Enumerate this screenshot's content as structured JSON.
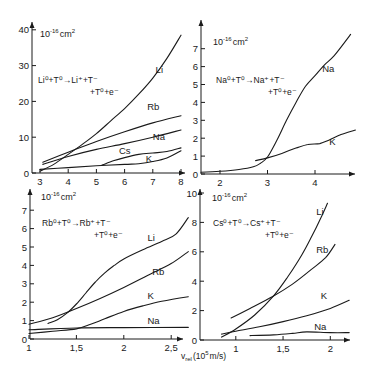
{
  "figure": {
    "x_axis_label": "v_rel (10^5 m/s)",
    "x_axis_label_main": "v",
    "x_axis_label_sub": "rel",
    "x_axis_label_unit": "(10",
    "x_axis_label_exp": "5",
    "x_axis_label_tail": "m/s)"
  },
  "chart_data": [
    {
      "type": "line",
      "panel": "top-left",
      "title": "Li0 + T0 -> Li+ + T- + T0 + e-",
      "reaction_line1": "Li⁰+T⁰→Li⁺+T⁻",
      "reaction_line2": "+T⁰+e⁻",
      "ylabel": "10^-16 cm^2",
      "xlabel": "v_rel (10^5 m/s)",
      "xlim": [
        3,
        8.1
      ],
      "ylim": [
        0,
        40
      ],
      "xticks": [
        3,
        4,
        5,
        6,
        7,
        8
      ],
      "yticks": [
        0,
        10,
        20,
        30,
        40
      ],
      "grid": false,
      "series": [
        {
          "name": "Li",
          "points": [
            [
              3.0,
              0.5
            ],
            [
              3.5,
              2.5
            ],
            [
              4.0,
              5.2
            ],
            [
              4.5,
              8
            ],
            [
              5.0,
              11
            ],
            [
              5.5,
              14.5
            ],
            [
              6.0,
              18
            ],
            [
              6.5,
              22
            ],
            [
              7.0,
              26.5
            ],
            [
              7.5,
              32
            ],
            [
              8.0,
              38.5
            ]
          ],
          "label_at": [
            7.1,
            28
          ]
        },
        {
          "name": "Rb",
          "points": [
            [
              3.1,
              3
            ],
            [
              4.0,
              5.8
            ],
            [
              5.0,
              8.8
            ],
            [
              6.0,
              11.5
            ],
            [
              7.0,
              14
            ],
            [
              8.0,
              16
            ]
          ],
          "label_at": [
            6.8,
            17.5
          ]
        },
        {
          "name": "Na",
          "points": [
            [
              3.1,
              2.4
            ],
            [
              4.0,
              4.6
            ],
            [
              5.0,
              6.6
            ],
            [
              6.0,
              8.2
            ],
            [
              7.0,
              10
            ],
            [
              8.0,
              12
            ]
          ],
          "label_at": [
            7.0,
            9.2
          ]
        },
        {
          "name": "Cs",
          "points": [
            [
              5.2,
              2.2
            ],
            [
              5.6,
              3.4
            ],
            [
              6.0,
              4.3
            ],
            [
              6.5,
              5.2
            ],
            [
              7.0,
              5.6
            ],
            [
              7.5,
              6
            ],
            [
              8.0,
              7
            ]
          ],
          "label_at": [
            5.8,
            5.2
          ]
        },
        {
          "name": "K",
          "points": [
            [
              3.0,
              1.0
            ],
            [
              4.0,
              1.5
            ],
            [
              5.0,
              2
            ],
            [
              6.0,
              2.4
            ],
            [
              6.5,
              2.6
            ],
            [
              7.0,
              3.2
            ],
            [
              7.5,
              4.2
            ],
            [
              8.0,
              6.2
            ]
          ],
          "label_at": [
            6.75,
            3.2
          ]
        }
      ]
    },
    {
      "type": "line",
      "panel": "top-right",
      "title": "Na0 + T0 -> Na+ + T- + T0 + e-",
      "reaction_line1": "Na⁰+T⁰→Na⁺+T⁻",
      "reaction_line2": "+T⁰+e⁻",
      "ylabel": "10^-16 cm^2",
      "xlabel": "v_rel (10^5 m/s)",
      "xlim": [
        1.6,
        4.85
      ],
      "ylim": [
        0,
        7.5
      ],
      "xticks": [
        2,
        3,
        4
      ],
      "yticks": [
        0,
        1,
        2,
        3,
        4,
        5,
        6,
        7
      ],
      "grid": false,
      "series": [
        {
          "name": "Na",
          "points": [
            [
              1.6,
              0.1
            ],
            [
              2.0,
              0.15
            ],
            [
              2.4,
              0.25
            ],
            [
              2.7,
              0.4
            ],
            [
              2.85,
              0.6
            ],
            [
              3.0,
              0.95
            ],
            [
              3.2,
              1.9
            ],
            [
              3.4,
              3.0
            ],
            [
              3.6,
              4.0
            ],
            [
              3.8,
              4.9
            ],
            [
              4.0,
              5.5
            ],
            [
              4.2,
              6.1
            ],
            [
              4.4,
              6.6
            ],
            [
              4.75,
              7.8
            ]
          ],
          "label_at": [
            4.15,
            5.7
          ]
        },
        {
          "name": "K",
          "points": [
            [
              2.75,
              0.75
            ],
            [
              3.0,
              0.9
            ],
            [
              3.3,
              1.15
            ],
            [
              3.6,
              1.45
            ],
            [
              3.85,
              1.65
            ],
            [
              4.1,
              1.7
            ],
            [
              4.3,
              1.9
            ],
            [
              4.55,
              2.2
            ],
            [
              4.85,
              2.45
            ]
          ],
          "label_at": [
            4.3,
            1.6
          ]
        }
      ]
    },
    {
      "type": "line",
      "panel": "bottom-left",
      "title": "Rb0 + T0 -> Rb+ + T- + T0 + e-",
      "reaction_line1": "Rb⁰+T⁰→Rb⁺+T⁻",
      "reaction_line2": "+T⁰+e⁻",
      "ylabel": "10^-16 cm^2",
      "xlabel": "v_rel (10^5 m/s)",
      "xlim": [
        1,
        2.68
      ],
      "ylim": [
        0,
        7.5
      ],
      "xticks": [
        1,
        1.5,
        2,
        2.5
      ],
      "xticklabels": [
        "1",
        "1,5",
        "2",
        "2,5"
      ],
      "yticks": [
        0,
        1,
        2,
        3,
        4,
        5,
        6,
        7
      ],
      "grid": false,
      "series": [
        {
          "name": "Li",
          "points": [
            [
              1.2,
              0.85
            ],
            [
              1.3,
              1.05
            ],
            [
              1.4,
              1.4
            ],
            [
              1.5,
              1.9
            ],
            [
              1.6,
              2.5
            ],
            [
              1.7,
              3.1
            ],
            [
              1.8,
              3.6
            ],
            [
              1.9,
              4.0
            ],
            [
              2.0,
              4.35
            ],
            [
              2.2,
              4.85
            ],
            [
              2.4,
              5.3
            ],
            [
              2.55,
              5.7
            ],
            [
              2.68,
              6.6
            ]
          ],
          "label_at": [
            2.25,
            5.3
          ]
        },
        {
          "name": "Rb",
          "points": [
            [
              1.0,
              0.8
            ],
            [
              1.25,
              1.15
            ],
            [
              1.5,
              1.65
            ],
            [
              1.75,
              2.2
            ],
            [
              2.0,
              2.8
            ],
            [
              2.25,
              3.45
            ],
            [
              2.5,
              4.1
            ],
            [
              2.68,
              4.75
            ]
          ],
          "label_at": [
            2.3,
            3.5
          ]
        },
        {
          "name": "K",
          "points": [
            [
              1.0,
              0.3
            ],
            [
              1.25,
              0.42
            ],
            [
              1.5,
              0.55
            ],
            [
              1.65,
              0.8
            ],
            [
              1.8,
              1.1
            ],
            [
              2.0,
              1.5
            ],
            [
              2.2,
              1.8
            ],
            [
              2.4,
              2.05
            ],
            [
              2.68,
              2.3
            ]
          ],
          "label_at": [
            2.25,
            2.2
          ]
        },
        {
          "name": "Na",
          "points": [
            [
              1.0,
              0.5
            ],
            [
              1.5,
              0.6
            ],
            [
              2.0,
              0.62
            ],
            [
              2.68,
              0.63
            ]
          ],
          "label_at": [
            2.25,
            0.8
          ]
        }
      ]
    },
    {
      "type": "line",
      "panel": "bottom-right",
      "title": "Cs0 + T0 -> Cs+ + T- + T0 + e-",
      "reaction_line1": "Cs⁰+T⁰→Cs⁺+T⁻",
      "reaction_line2": "+T⁰+e⁻",
      "ylabel": "10^-16 cm^2",
      "xlabel": "v_rel (10^5 m/s)",
      "xlim": [
        0.6,
        2.25
      ],
      "ylim": [
        0,
        10
      ],
      "xticks": [
        1,
        1.5,
        2
      ],
      "xticklabels": [
        "1",
        "1,5",
        "2"
      ],
      "yticks": [
        0,
        2,
        4,
        6,
        8,
        10
      ],
      "grid": false,
      "series": [
        {
          "name": "Li",
          "points": [
            [
              0.85,
              0.2
            ],
            [
              1.0,
              0.75
            ],
            [
              1.2,
              1.7
            ],
            [
              1.4,
              3.0
            ],
            [
              1.55,
              4.3
            ],
            [
              1.7,
              5.8
            ],
            [
              1.8,
              7.0
            ],
            [
              1.9,
              8.3
            ],
            [
              1.97,
              9.3
            ]
          ],
          "label_at": [
            1.85,
            8.5
          ]
        },
        {
          "name": "Rb",
          "points": [
            [
              0.95,
              1.5
            ],
            [
              1.15,
              2.15
            ],
            [
              1.4,
              3.0
            ],
            [
              1.6,
              3.8
            ],
            [
              1.8,
              4.8
            ],
            [
              1.95,
              5.6
            ],
            [
              2.05,
              6.5
            ]
          ],
          "label_at": [
            1.85,
            5.9
          ]
        },
        {
          "name": "K",
          "points": [
            [
              0.85,
              0.4
            ],
            [
              1.0,
              0.6
            ],
            [
              1.25,
              0.9
            ],
            [
              1.5,
              1.25
            ],
            [
              1.75,
              1.65
            ],
            [
              2.0,
              2.15
            ],
            [
              2.2,
              2.7
            ]
          ],
          "label_at": [
            1.9,
            2.8
          ]
        },
        {
          "name": "Na",
          "points": [
            [
              1.15,
              0.3
            ],
            [
              1.4,
              0.35
            ],
            [
              1.6,
              0.45
            ],
            [
              1.75,
              0.55
            ],
            [
              2.0,
              0.5
            ],
            [
              2.2,
              0.5
            ]
          ],
          "label_at": [
            1.83,
            0.7
          ]
        }
      ]
    }
  ],
  "layout": {
    "panels": [
      {
        "x0": 32,
        "x1": 185,
        "y0": 173,
        "ytop": 22,
        "xpx_at_min": 40,
        "xpx_per_unit": 28.2,
        "ypx_per_unit": 3.58,
        "label_pos": [
          40,
          37
        ],
        "reaction_pos": [
          38,
          83
        ]
      },
      {
        "x0": 201,
        "x1": 355,
        "y0": 174,
        "ytop": 20,
        "xpx_at_min": 201,
        "xpx_per_unit": 47.5,
        "ypx_per_unit": 17.9,
        "label_pos": [
          213,
          45
        ],
        "reaction_pos": [
          216,
          83
        ]
      },
      {
        "x0": 30,
        "x1": 183,
        "y0": 339,
        "ytop": 189,
        "xpx_at_min": 29,
        "xpx_per_unit": 94.8,
        "ypx_per_unit": 18.4,
        "label_pos": [
          41,
          200
        ],
        "reaction_pos": [
          42,
          226
        ]
      },
      {
        "x0": 200,
        "x1": 350,
        "y0": 340,
        "ytop": 189,
        "xpx_at_min": 198,
        "xpx_per_unit": 94.5,
        "ypx_per_unit": 14.7,
        "label_pos": [
          212,
          201
        ],
        "reaction_pos": [
          213,
          226
        ]
      }
    ]
  }
}
